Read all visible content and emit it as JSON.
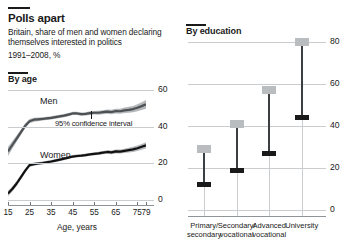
{
  "header": {
    "title": "Polls apart",
    "subtitle_line1": "Britain, share of men and women declaring",
    "subtitle_line2": "themselves interested in politics",
    "subtitle_line3": "1991–2008, %"
  },
  "left": {
    "section_title": "By age",
    "men_label": "Men",
    "women_label": "Women",
    "ci_label": "95% confidence interval",
    "xlabel": "Age, years"
  },
  "right": {
    "section_title": "By education"
  },
  "chart_data": [
    {
      "type": "line",
      "title": "By age",
      "xlabel": "Age, years",
      "ylabel": "",
      "xlim": [
        15,
        79
      ],
      "ylim": [
        0,
        60
      ],
      "xticks": [
        15,
        25,
        35,
        45,
        55,
        65,
        75,
        79
      ],
      "yticks": [
        0,
        20,
        40,
        60
      ],
      "grid": "horizontal",
      "annotations": [
        "95% confidence interval"
      ],
      "x": [
        15,
        17,
        19,
        21,
        23,
        25,
        27,
        29,
        31,
        33,
        35,
        37,
        39,
        41,
        43,
        45,
        47,
        49,
        51,
        53,
        55,
        57,
        59,
        61,
        63,
        65,
        67,
        69,
        71,
        73,
        75,
        77,
        79
      ],
      "series": [
        {
          "name": "Men",
          "color": "#4d5154",
          "band": "95% confidence interval",
          "values": [
            26.5,
            30.0,
            33.5,
            37.0,
            40.5,
            43.0,
            43.8,
            44.0,
            44.2,
            44.5,
            44.8,
            45.2,
            45.6,
            46.0,
            46.6,
            47.2,
            47.2,
            46.8,
            47.0,
            47.4,
            47.6,
            47.6,
            47.9,
            48.2,
            48.0,
            48.5,
            48.4,
            48.9,
            49.2,
            49.6,
            50.3,
            51.2,
            52.2
          ],
          "band_lower": [
            24.0,
            28.0,
            31.8,
            35.5,
            39.2,
            41.8,
            42.7,
            43.0,
            43.3,
            43.6,
            43.9,
            44.3,
            44.7,
            45.1,
            45.7,
            46.3,
            46.3,
            45.9,
            46.1,
            46.4,
            46.6,
            46.5,
            46.8,
            47.0,
            46.8,
            47.2,
            47.0,
            47.4,
            47.6,
            47.9,
            48.4,
            49.1,
            49.8
          ],
          "band_upper": [
            29.0,
            32.0,
            35.2,
            38.5,
            41.8,
            44.2,
            44.9,
            45.0,
            45.1,
            45.4,
            45.7,
            46.1,
            46.5,
            46.9,
            47.5,
            48.1,
            48.1,
            47.7,
            47.9,
            48.4,
            48.6,
            48.7,
            49.0,
            49.4,
            49.2,
            49.8,
            49.8,
            50.4,
            50.8,
            51.3,
            52.2,
            53.3,
            54.6
          ]
        },
        {
          "name": "Women",
          "color": "#111111",
          "band": "95% confidence interval",
          "values": [
            3.5,
            6.0,
            9.0,
            12.5,
            16.0,
            19.0,
            19.6,
            19.9,
            20.2,
            20.6,
            21.0,
            21.5,
            22.0,
            22.5,
            23.1,
            23.7,
            24.0,
            24.2,
            24.5,
            24.9,
            25.2,
            25.4,
            25.8,
            26.2,
            26.0,
            26.5,
            26.4,
            26.8,
            27.2,
            27.6,
            28.2,
            29.0,
            29.8
          ],
          "band_lower": [
            2.0,
            4.6,
            7.6,
            11.2,
            14.8,
            18.0,
            18.7,
            19.1,
            19.4,
            19.8,
            20.2,
            20.7,
            21.2,
            21.7,
            22.3,
            22.9,
            23.2,
            23.4,
            23.7,
            24.1,
            24.4,
            24.5,
            24.9,
            25.2,
            25.0,
            25.4,
            25.3,
            25.6,
            25.9,
            26.2,
            26.7,
            27.4,
            28.1
          ],
          "band_upper": [
            5.0,
            7.4,
            10.4,
            13.8,
            17.2,
            20.0,
            20.5,
            20.7,
            21.0,
            21.4,
            21.8,
            22.3,
            22.8,
            23.3,
            23.9,
            24.5,
            24.8,
            25.0,
            25.3,
            25.7,
            26.0,
            26.3,
            26.7,
            27.2,
            27.0,
            27.6,
            27.5,
            28.0,
            28.5,
            29.0,
            29.7,
            30.6,
            31.5
          ]
        }
      ]
    },
    {
      "type": "range",
      "title": "By education",
      "xlabel": "",
      "ylabel": "",
      "ylim": [
        0,
        80
      ],
      "yticks": [
        0,
        20,
        40,
        60,
        80
      ],
      "grid": "horizontal",
      "categories": [
        "Primary/\nsecondary",
        "Secondary/\nvocational",
        "Advanced\nvocational",
        "University"
      ],
      "category_lines": [
        {
          "label_line1": "Primary/",
          "label_line2": "secondary",
          "high": 29,
          "low": 12
        },
        {
          "label_line1": "Secondary/",
          "label_line2": "vocational",
          "high": 41,
          "low": 19
        },
        {
          "label_line1": "Advanced",
          "label_line2": "vocational",
          "high": 57,
          "low": 27
        },
        {
          "label_line1": "University",
          "label_line2": "",
          "high": 80,
          "low": 44
        }
      ],
      "marker_high_color": "#b9bdc0",
      "marker_low_color": "#1a1a1a"
    }
  ]
}
